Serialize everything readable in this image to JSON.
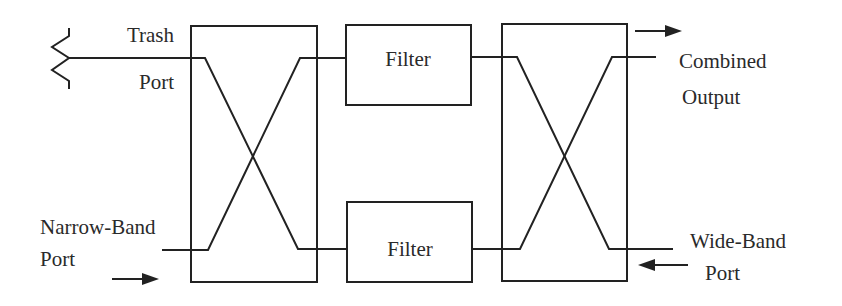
{
  "diagram": {
    "type": "block-diagram",
    "stroke_color": "#222222",
    "text_color": "#2a2a2a",
    "ports": {
      "trash": {
        "line1": "Trash",
        "line2": "Port"
      },
      "narrow_band": {
        "line1": "Narrow-Band",
        "line2": "Port"
      },
      "combined_output": {
        "line1": "Combined",
        "line2": "Output"
      },
      "wide_band": {
        "line1": "Wide-Band",
        "line2": "Port"
      }
    },
    "blocks": {
      "left_coupler": {
        "label": ""
      },
      "right_coupler": {
        "label": ""
      },
      "upper_filter": {
        "label": "Filter"
      },
      "lower_filter": {
        "label": "Filter"
      }
    },
    "symbols": {
      "termination": "resistor-termination-icon",
      "narrow_band_arrow": "arrow-right-icon",
      "combined_output_arrow": "arrow-right-icon",
      "wide_band_arrow": "arrow-left-icon"
    }
  }
}
